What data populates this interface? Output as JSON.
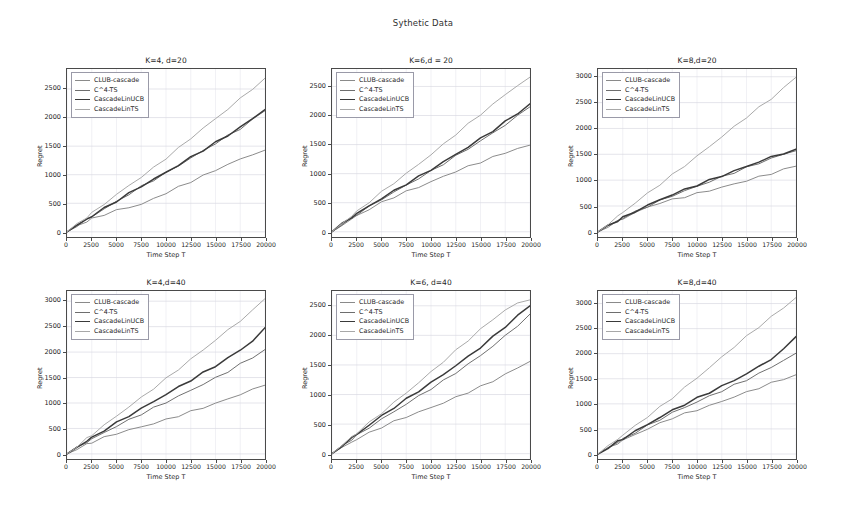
{
  "figure": {
    "suptitle": "Sythetic Data",
    "xlabel": "Time Step T",
    "ylabel": "Regret"
  },
  "series_names": [
    "CLUB-cascade",
    "C^4-TS",
    "CascadeLinUCB",
    "CascadeLinTS"
  ],
  "series_colors": [
    "#8a8a8a",
    "#6e6e6e",
    "#3a3a3a",
    "#a8a8a8"
  ],
  "xticks": [
    "0",
    "2500",
    "5000",
    "7500",
    "10000",
    "12500",
    "15000",
    "17500",
    "20000"
  ],
  "chart_data": [
    {
      "type": "line",
      "title": "K=4, d=20",
      "xlabel": "Time Step T",
      "ylabel": "Regret",
      "xlim": [
        0,
        20000
      ],
      "ylim": [
        -90,
        2850
      ],
      "grid": true,
      "legend_position": "upper left",
      "xticks": [
        0,
        2500,
        5000,
        7500,
        10000,
        12500,
        15000,
        17500,
        20000
      ],
      "yticks": [
        0,
        500,
        1000,
        1500,
        2000,
        2500
      ],
      "x": [
        0,
        1000,
        2000,
        2500,
        3750,
        5000,
        6250,
        7500,
        8750,
        10000,
        11250,
        12500,
        13750,
        15000,
        16250,
        17500,
        18750,
        20000
      ],
      "series": [
        {
          "name": "CLUB-cascade",
          "values": [
            0,
            100,
            185,
            225,
            305,
            375,
            430,
            480,
            580,
            680,
            780,
            880,
            980,
            1080,
            1180,
            1270,
            1360,
            1430
          ]
        },
        {
          "name": "C^4-TS",
          "values": [
            0,
            110,
            215,
            270,
            400,
            530,
            660,
            790,
            910,
            1030,
            1160,
            1290,
            1420,
            1550,
            1680,
            1810,
            1960,
            2120
          ]
        },
        {
          "name": "CascadeLinUCB",
          "values": [
            0,
            115,
            220,
            275,
            410,
            540,
            670,
            800,
            920,
            1040,
            1170,
            1300,
            1430,
            1560,
            1690,
            1830,
            1980,
            2140
          ]
        },
        {
          "name": "CascadeLinTS",
          "values": [
            0,
            130,
            260,
            325,
            490,
            650,
            810,
            960,
            1120,
            1290,
            1460,
            1640,
            1810,
            1980,
            2150,
            2330,
            2510,
            2690
          ]
        }
      ]
    },
    {
      "type": "line",
      "title": "K=6,d = 20",
      "xlabel": "Time Step T",
      "ylabel": "Regret",
      "xlim": [
        0,
        20000
      ],
      "ylim": [
        -90,
        2800
      ],
      "grid": true,
      "legend_position": "upper left",
      "xticks": [
        0,
        2500,
        5000,
        7500,
        10000,
        12500,
        15000,
        17500,
        20000
      ],
      "yticks": [
        0,
        500,
        1000,
        1500,
        2000,
        2500
      ],
      "x": [
        0,
        1000,
        2000,
        2500,
        3750,
        5000,
        6250,
        7500,
        8750,
        10000,
        11250,
        12500,
        13750,
        15000,
        16250,
        17500,
        18750,
        20000
      ],
      "series": [
        {
          "name": "CLUB-cascade",
          "values": [
            0,
            115,
            220,
            275,
            390,
            500,
            600,
            690,
            770,
            860,
            950,
            1040,
            1120,
            1200,
            1280,
            1360,
            1430,
            1490
          ]
        },
        {
          "name": "C^4-TS",
          "values": [
            0,
            125,
            240,
            300,
            430,
            560,
            680,
            800,
            920,
            1040,
            1170,
            1300,
            1430,
            1560,
            1700,
            1840,
            1990,
            2150
          ]
        },
        {
          "name": "CascadeLinUCB",
          "values": [
            0,
            130,
            250,
            310,
            445,
            575,
            700,
            825,
            945,
            1070,
            1200,
            1330,
            1460,
            1600,
            1740,
            1890,
            2040,
            2200
          ]
        },
        {
          "name": "CascadeLinTS",
          "values": [
            0,
            140,
            275,
            345,
            515,
            680,
            840,
            1000,
            1160,
            1330,
            1500,
            1680,
            1850,
            2020,
            2190,
            2360,
            2520,
            2660
          ]
        }
      ]
    },
    {
      "type": "line",
      "title": "K=8,d=20",
      "xlabel": "Time Step T",
      "ylabel": "Regret",
      "xlim": [
        0,
        20000
      ],
      "ylim": [
        -100,
        3150
      ],
      "grid": true,
      "legend_position": "upper left",
      "xticks": [
        0,
        2500,
        5000,
        7500,
        10000,
        12500,
        15000,
        17500,
        20000
      ],
      "yticks": [
        0,
        500,
        1000,
        1500,
        2000,
        2500,
        3000
      ],
      "x": [
        0,
        1000,
        2000,
        2500,
        3750,
        5000,
        6250,
        7500,
        8750,
        10000,
        11250,
        12500,
        13750,
        15000,
        16250,
        17500,
        18750,
        20000
      ],
      "series": [
        {
          "name": "CLUB-cascade",
          "values": [
            0,
            105,
            205,
            255,
            370,
            475,
            560,
            620,
            680,
            740,
            800,
            860,
            925,
            990,
            1060,
            1130,
            1200,
            1270
          ]
        },
        {
          "name": "C^4-TS",
          "values": [
            0,
            110,
            215,
            265,
            385,
            495,
            600,
            700,
            790,
            880,
            970,
            1060,
            1150,
            1240,
            1330,
            1420,
            1500,
            1570
          ]
        },
        {
          "name": "CascadeLinUCB",
          "values": [
            0,
            112,
            220,
            272,
            395,
            510,
            620,
            720,
            815,
            905,
            995,
            1085,
            1175,
            1265,
            1355,
            1445,
            1525,
            1600
          ]
        },
        {
          "name": "CascadeLinTS",
          "values": [
            0,
            150,
            300,
            375,
            560,
            740,
            920,
            1100,
            1280,
            1460,
            1650,
            1840,
            2030,
            2220,
            2400,
            2580,
            2780,
            2990
          ]
        }
      ]
    },
    {
      "type": "line",
      "title": "K=4,d=40",
      "xlabel": "Time Step T",
      "ylabel": "Regret",
      "xlim": [
        0,
        20000
      ],
      "ylim": [
        -100,
        3200
      ],
      "grid": true,
      "legend_position": "upper left",
      "xticks": [
        0,
        2500,
        5000,
        7500,
        10000,
        12500,
        15000,
        17500,
        20000
      ],
      "yticks": [
        0,
        500,
        1000,
        1500,
        2000,
        2500,
        3000
      ],
      "x": [
        0,
        1000,
        2000,
        2500,
        3750,
        5000,
        6250,
        7500,
        8750,
        10000,
        11250,
        12500,
        13750,
        15000,
        16250,
        17500,
        18750,
        20000
      ],
      "series": [
        {
          "name": "CLUB-cascade",
          "values": [
            0,
            95,
            185,
            230,
            320,
            400,
            470,
            530,
            600,
            670,
            750,
            830,
            910,
            990,
            1080,
            1170,
            1260,
            1350
          ]
        },
        {
          "name": "C^4-TS",
          "values": [
            0,
            120,
            235,
            290,
            420,
            545,
            665,
            785,
            900,
            1015,
            1130,
            1250,
            1370,
            1490,
            1620,
            1760,
            1900,
            2050
          ]
        },
        {
          "name": "CascadeLinUCB",
          "values": [
            0,
            130,
            255,
            315,
            465,
            610,
            750,
            890,
            1030,
            1170,
            1310,
            1450,
            1590,
            1730,
            1880,
            2040,
            2220,
            2480
          ]
        },
        {
          "name": "CascadeLinTS",
          "values": [
            0,
            150,
            300,
            375,
            560,
            745,
            925,
            1105,
            1290,
            1475,
            1665,
            1855,
            2045,
            2235,
            2430,
            2620,
            2810,
            3050
          ]
        }
      ]
    },
    {
      "type": "line",
      "title": "K=6, d=40",
      "xlabel": "Time Step T",
      "ylabel": "Regret",
      "xlim": [
        0,
        20000
      ],
      "ylim": [
        -90,
        2750
      ],
      "grid": true,
      "legend_position": "upper left",
      "xticks": [
        0,
        2500,
        5000,
        7500,
        10000,
        12500,
        15000,
        17500,
        20000
      ],
      "yticks": [
        0,
        500,
        1000,
        1500,
        2000,
        2500
      ],
      "x": [
        0,
        1000,
        2000,
        2500,
        3750,
        5000,
        6250,
        7500,
        8750,
        10000,
        11250,
        12500,
        13750,
        15000,
        16250,
        17500,
        18750,
        20000
      ],
      "series": [
        {
          "name": "CLUB-cascade",
          "values": [
            0,
            100,
            195,
            245,
            350,
            450,
            540,
            625,
            700,
            780,
            860,
            950,
            1040,
            1130,
            1230,
            1340,
            1450,
            1560
          ]
        },
        {
          "name": "C^4-TS",
          "values": [
            0,
            125,
            245,
            305,
            445,
            580,
            710,
            840,
            970,
            1100,
            1230,
            1370,
            1510,
            1660,
            1820,
            1990,
            2170,
            2360
          ]
        },
        {
          "name": "CascadeLinUCB",
          "values": [
            0,
            135,
            265,
            330,
            485,
            635,
            780,
            920,
            1060,
            1200,
            1340,
            1490,
            1640,
            1800,
            1970,
            2150,
            2330,
            2500
          ]
        },
        {
          "name": "CascadeLinTS",
          "values": [
            0,
            140,
            280,
            350,
            520,
            690,
            860,
            1030,
            1200,
            1380,
            1560,
            1740,
            1920,
            2100,
            2270,
            2430,
            2540,
            2600
          ]
        }
      ]
    },
    {
      "type": "line",
      "title": "K=8,d=40",
      "xlabel": "Time Step T",
      "ylabel": "Regret",
      "xlim": [
        0,
        20000
      ],
      "ylim": [
        -100,
        3250
      ],
      "grid": true,
      "legend_position": "upper left",
      "xticks": [
        0,
        2500,
        5000,
        7500,
        10000,
        12500,
        15000,
        17500,
        20000
      ],
      "yticks": [
        0,
        500,
        1000,
        1500,
        2000,
        2500,
        3000
      ],
      "x": [
        0,
        1000,
        2000,
        2500,
        3750,
        5000,
        6250,
        7500,
        8750,
        10000,
        11250,
        12500,
        13750,
        15000,
        16250,
        17500,
        18750,
        20000
      ],
      "series": [
        {
          "name": "CLUB-cascade",
          "values": [
            0,
            110,
            215,
            270,
            390,
            500,
            610,
            720,
            800,
            880,
            960,
            1050,
            1140,
            1230,
            1320,
            1410,
            1500,
            1580
          ]
        },
        {
          "name": "C^4-TS",
          "values": [
            0,
            120,
            235,
            295,
            430,
            560,
            690,
            820,
            930,
            1040,
            1150,
            1260,
            1370,
            1480,
            1600,
            1730,
            1870,
            2010
          ]
        },
        {
          "name": "CascadeLinUCB",
          "values": [
            0,
            125,
            245,
            305,
            450,
            590,
            730,
            870,
            990,
            1110,
            1230,
            1350,
            1470,
            1600,
            1740,
            1900,
            2080,
            2340
          ]
        },
        {
          "name": "CascadeLinTS",
          "values": [
            0,
            150,
            300,
            375,
            560,
            745,
            930,
            1120,
            1320,
            1520,
            1720,
            1930,
            2140,
            2340,
            2540,
            2730,
            2920,
            3120
          ]
        }
      ]
    }
  ]
}
